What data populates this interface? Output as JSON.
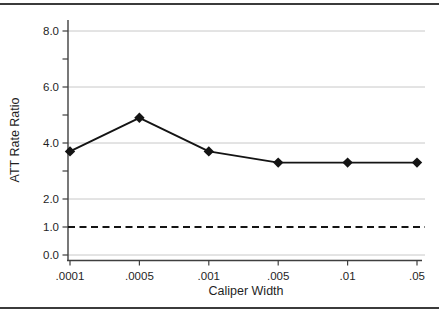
{
  "chart_data": {
    "type": "line",
    "title": "",
    "xlabel": "Caliper Width",
    "ylabel": "ATT Rate Ratio",
    "categories": [
      ".0001",
      ".0005",
      ".001",
      ".005",
      ".01",
      ".05"
    ],
    "series": [
      {
        "name": "ATT rate ratio",
        "marker": "diamond",
        "line_style": "solid",
        "color": "#141414",
        "values": [
          3.7,
          4.9,
          3.7,
          3.3,
          3.3,
          3.3
        ]
      }
    ],
    "reference_line": {
      "value": 1.0,
      "line_style": "dashed",
      "color": "#141414"
    },
    "y_axis": {
      "min": 0,
      "max": 8.4,
      "minor_tick_values": [
        0,
        1,
        2,
        3,
        4,
        5,
        6,
        7,
        8
      ],
      "labeled_tick_values": [
        0,
        1,
        2,
        4,
        6,
        8
      ],
      "labeled_tick_texts": [
        "0.0",
        "1.0",
        "2.0",
        "4.0",
        "6.0",
        "8.0"
      ],
      "gridline_values": [
        0,
        2,
        4,
        6,
        8
      ]
    },
    "x_axis": {
      "tick_labels": [
        ".0001",
        ".0005",
        ".001",
        ".005",
        ".01",
        ".05"
      ]
    },
    "grid": "horizontal",
    "legend": "none",
    "colors": {
      "background": "#ffffff",
      "gridline": "#c8c8c8",
      "axis": "#3f3f3f",
      "text": "#1f1f1f",
      "data_line": "#141414",
      "frame_rule": "#3b3b3b"
    }
  }
}
